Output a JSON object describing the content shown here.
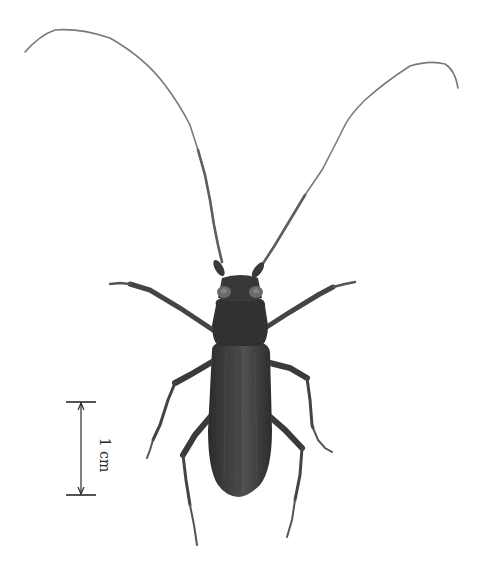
{
  "figure": {
    "colors": {
      "background": "#ffffff",
      "body": "#3a3a3a",
      "body_highlight": "#5a5a5a",
      "antenna": "#6a6a6a",
      "legs": "#404040",
      "scale_bar": "#2a2a2a"
    }
  },
  "scale_bar": {
    "label": "1 cm",
    "orientation": "vertical"
  }
}
